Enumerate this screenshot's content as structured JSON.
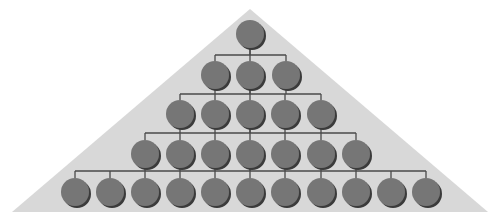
{
  "diagram": {
    "type": "hierarchy-pyramid",
    "width": 490,
    "height": 222,
    "colors": {
      "background": "#ffffff",
      "pyramid": "#d8d8d8",
      "node_fill": "#767676",
      "node_shadow": "#3a3a3a",
      "connector": "#4a4a4a"
    },
    "pyramid": {
      "apex": [
        250,
        9
      ],
      "bottom_left": [
        12,
        212
      ],
      "bottom_right": [
        488,
        212
      ]
    },
    "node_radius": 14,
    "levels": [
      {
        "level": 1,
        "count": 1,
        "y": 34,
        "bus_y": null,
        "x": [
          250
        ]
      },
      {
        "level": 2,
        "count": 3,
        "y": 75,
        "bus_y": 55,
        "x": [
          215,
          250,
          286
        ]
      },
      {
        "level": 3,
        "count": 5,
        "y": 114,
        "bus_y": 94,
        "x": [
          180,
          215,
          250,
          285,
          321
        ]
      },
      {
        "level": 4,
        "count": 7,
        "y": 154,
        "bus_y": 133,
        "x": [
          145,
          180,
          215,
          250,
          285,
          321,
          356
        ]
      },
      {
        "level": 5,
        "count": 11,
        "y": 192,
        "bus_y": 171,
        "x": [
          75,
          110,
          145,
          180,
          215,
          250,
          285,
          321,
          356,
          391,
          426
        ]
      }
    ]
  }
}
